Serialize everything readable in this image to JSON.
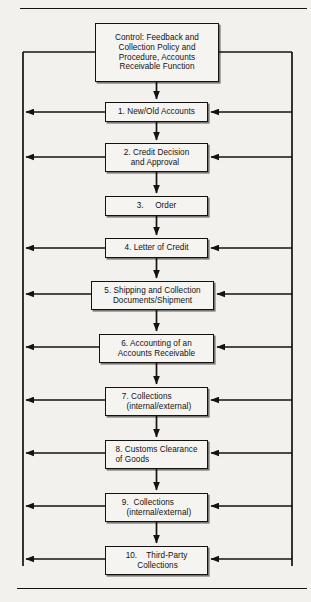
{
  "figure": {
    "background_color": "#f3f1ee",
    "line_color": "#15120f",
    "box_fill": "#f6f4f1",
    "top_rule": "horizontal-rule-top",
    "bottom_rule": "horizontal-rule-bottom"
  },
  "control_box": {
    "name": "control-feedback-box",
    "lines": [
      "Control: Feedback and",
      "Collection Policy and",
      "Procedure, Accounts",
      "Receivable Function"
    ]
  },
  "steps": [
    {
      "number": "1.",
      "name": "step-new-old-accounts",
      "lines": [
        "1. New/Old Accounts"
      ],
      "align": "lead",
      "feedback_left": true,
      "feedback_right": true
    },
    {
      "number": "2.",
      "name": "step-credit-decision-and-approval",
      "lines": [
        "2. Credit Decision",
        "   and Approval"
      ],
      "align": "lead",
      "feedback_left": true,
      "feedback_right": true
    },
    {
      "number": "3.",
      "name": "step-order",
      "lines": [
        "3.     Order"
      ],
      "align": "lead",
      "feedback_left": false,
      "feedback_right": false
    },
    {
      "number": "4.",
      "name": "step-letter-of-credit",
      "lines": [
        "4. Letter of Credit"
      ],
      "align": "lead",
      "feedback_left": true,
      "feedback_right": true
    },
    {
      "number": "5.",
      "name": "step-shipping-and-collection-documents",
      "lines": [
        "5. Shipping and Collection",
        "Documents/Shipment"
      ],
      "align": "ctr",
      "feedback_left": true,
      "feedback_right": true
    },
    {
      "number": "6.",
      "name": "step-accounting-of-an-accounts-receivable",
      "lines": [
        "6. Accounting of an",
        "Accounts Receivable"
      ],
      "align": "ctr",
      "feedback_left": true,
      "feedback_right": true
    },
    {
      "number": "7.",
      "name": "step-collections-internal-external-7",
      "lines": [
        "7. Collections",
        "  (internal/external)"
      ],
      "align": "lead",
      "feedback_left": true,
      "feedback_right": true
    },
    {
      "number": "8.",
      "name": "step-customs-clearance-of-goods",
      "lines": [
        "8. Customs Clearance",
        "of Goods"
      ],
      "align": "lead",
      "feedback_left": true,
      "feedback_right": true
    },
    {
      "number": "9.",
      "name": "step-collections-internal-external-9",
      "lines": [
        "9.  Collections",
        "  (internal/external)"
      ],
      "align": "lead",
      "feedback_left": true,
      "feedback_right": true
    },
    {
      "number": "10.",
      "name": "step-third-party-collections",
      "lines": [
        "10.    Third-Party",
        "     Collections"
      ],
      "align": "lead",
      "feedback_left": true,
      "feedback_right": true
    }
  ]
}
